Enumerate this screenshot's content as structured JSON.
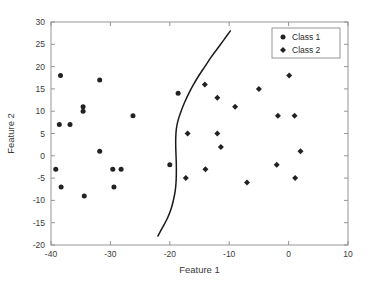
{
  "chart_data": {
    "type": "scatter",
    "title": "",
    "xlabel": "Feature 1",
    "ylabel": "Feature 2",
    "xlim": [
      -40,
      10
    ],
    "ylim": [
      -20,
      30
    ],
    "xticks": [
      -40,
      -30,
      -20,
      -10,
      0,
      10
    ],
    "yticks": [
      -20,
      -15,
      -10,
      -5,
      0,
      5,
      10,
      15,
      20,
      25,
      30
    ],
    "xtick_labels": [
      "-40",
      "-30",
      "-20",
      "-10",
      "0",
      "10"
    ],
    "ytick_labels": [
      "-20",
      "-15",
      "-10",
      "-5",
      "0",
      "5",
      "10",
      "15",
      "20",
      "25",
      "30"
    ],
    "grid": false,
    "legend_position": "top-right",
    "series": [
      {
        "name": "Class 1",
        "marker": "circle",
        "color": "#222222",
        "points": [
          [
            -38.4,
            18
          ],
          [
            -31.8,
            17
          ],
          [
            -34.6,
            11
          ],
          [
            -34.6,
            10
          ],
          [
            -26.2,
            9
          ],
          [
            -38.6,
            7
          ],
          [
            -36.8,
            7
          ],
          [
            -31.8,
            1
          ],
          [
            -20.0,
            -2
          ],
          [
            -39.2,
            -3
          ],
          [
            -29.6,
            -3
          ],
          [
            -28.2,
            -3
          ],
          [
            -38.3,
            -7
          ],
          [
            -29.4,
            -7
          ],
          [
            -34.4,
            -9
          ],
          [
            -18.6,
            14
          ]
        ]
      },
      {
        "name": "Class 2",
        "marker": "diamond",
        "color": "#222222",
        "points": [
          [
            0.1,
            18
          ],
          [
            -14.1,
            16
          ],
          [
            -5.0,
            15
          ],
          [
            -12.0,
            13
          ],
          [
            -9.0,
            11
          ],
          [
            -1.8,
            9
          ],
          [
            1.0,
            9
          ],
          [
            -17.0,
            5
          ],
          [
            -12.0,
            5
          ],
          [
            -11.4,
            2
          ],
          [
            2.0,
            1
          ],
          [
            -2.0,
            -2
          ],
          [
            -14.0,
            -3
          ],
          [
            -17.3,
            -5
          ],
          [
            1.1,
            -5
          ],
          [
            -7.0,
            -6
          ]
        ]
      }
    ],
    "decision_boundary": {
      "name": "decision-boundary",
      "color": "#1a1a1a",
      "points": [
        [
          -22.0,
          -18.0
        ],
        [
          -21.2,
          -16.0
        ],
        [
          -20.4,
          -14.0
        ],
        [
          -19.8,
          -12.0
        ],
        [
          -19.4,
          -10.0
        ],
        [
          -19.1,
          -8.0
        ],
        [
          -18.95,
          -6.0
        ],
        [
          -18.9,
          -4.0
        ],
        [
          -18.9,
          -2.0
        ],
        [
          -18.95,
          0.0
        ],
        [
          -19.0,
          2.0
        ],
        [
          -19.0,
          4.0
        ],
        [
          -18.9,
          6.0
        ],
        [
          -18.6,
          8.0
        ],
        [
          -18.1,
          10.0
        ],
        [
          -17.5,
          12.0
        ],
        [
          -16.8,
          14.0
        ],
        [
          -16.0,
          16.0
        ],
        [
          -15.1,
          18.0
        ],
        [
          -14.1,
          20.0
        ],
        [
          -13.1,
          22.0
        ],
        [
          -12.0,
          24.0
        ],
        [
          -10.9,
          26.0
        ],
        [
          -9.8,
          28.0
        ]
      ]
    },
    "legend": [
      {
        "label": "Class 1",
        "marker": "circle"
      },
      {
        "label": "Class 2",
        "marker": "diamond"
      }
    ]
  }
}
